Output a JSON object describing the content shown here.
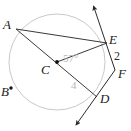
{
  "figure": {
    "kind": "circle-geometry-diagram",
    "width": 131,
    "height": 131,
    "background_color": "#ffffff",
    "circle": {
      "name": "circle-C",
      "center_label": "C",
      "center_x": 57,
      "center_y": 62,
      "radius": 48,
      "stroke_color": "#c9c9c9"
    },
    "stroke_colors": {
      "chord": "#3a3a3a",
      "secant": "#3a3a3a",
      "circle": "#c9c9c9",
      "point": "#111111",
      "faint_text": "#b7b7b7",
      "dark_text": "#1a1a1a"
    },
    "points": [
      {
        "id": "A",
        "label": "A",
        "x": 16,
        "y": 29,
        "label_x": 3,
        "label_y": 18,
        "on_circle": true,
        "dot": false
      },
      {
        "id": "B",
        "label": "B",
        "x": 11,
        "y": 88,
        "label_x": 2,
        "label_y": 86,
        "on_circle": true,
        "dot": true
      },
      {
        "id": "C",
        "label": "C",
        "x": 57,
        "y": 62,
        "label_x": 42,
        "label_y": 62,
        "on_circle": false,
        "dot": true
      },
      {
        "id": "D",
        "label": "D",
        "x": 97,
        "y": 97,
        "label_x": 101,
        "label_y": 92,
        "on_circle": true,
        "dot": false
      },
      {
        "id": "E",
        "label": "E",
        "x": 107,
        "y": 43,
        "label_x": 110,
        "label_y": 33,
        "on_circle": true,
        "dot": false
      },
      {
        "id": "F",
        "label": "F",
        "x": 115,
        "y": 70,
        "label_x": 118,
        "label_y": 66,
        "on_circle": false,
        "dot": false
      }
    ],
    "segments": [
      {
        "name": "chord-a-e",
        "from": "A",
        "to": "E"
      },
      {
        "name": "radius-c-e",
        "from": "C",
        "to": "E"
      },
      {
        "name": "segment-a-d-through-c",
        "from": "A",
        "to": "D"
      }
    ],
    "rays": [
      {
        "name": "ray-up-through-e-to-f",
        "from_x": 115,
        "from_y": 70,
        "to_x": 92,
        "to_y": 3,
        "arrow_at_end": true
      },
      {
        "name": "ray-down-through-d-from-f",
        "from_x": 115,
        "from_y": 70,
        "to_x": 74,
        "to_y": 128,
        "arrow_at_end": true
      }
    ],
    "measures": [
      {
        "name": "angle-measure-acE",
        "text": "57°",
        "x": 63,
        "y": 54,
        "style": "faint"
      },
      {
        "name": "arc-measure-4",
        "text": "4",
        "x": 71,
        "y": 81,
        "style": "faint"
      },
      {
        "name": "angle-measure-2",
        "text": "2",
        "x": 114,
        "y": 50,
        "style": "dark"
      }
    ]
  }
}
